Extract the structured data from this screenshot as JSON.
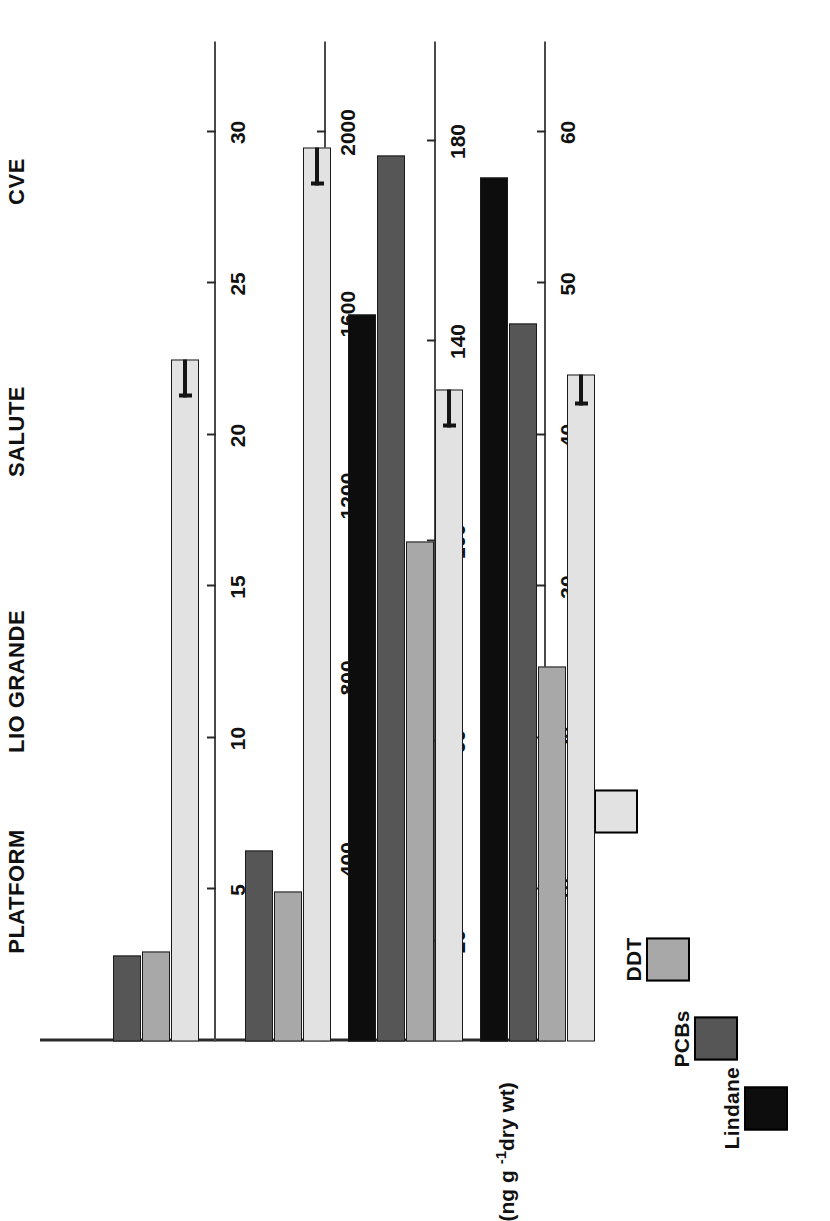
{
  "chart_data": {
    "type": "bar",
    "title": "",
    "orientation": "vertical-grouped-multi-axis",
    "categories": [
      "PLATFORM",
      "LIO GRANDE",
      "SALUTE",
      "CVE"
    ],
    "xlabel": "",
    "ylabel": "",
    "units_label": "(ng g",
    "units_sup": "-1",
    "units_tail": "dry wt)",
    "legend_position": "top-left",
    "grid": false,
    "series": [
      {
        "name": "Lindane",
        "color": "#0d0d0d",
        "axis": "lindane",
        "unit": "ng g-1 dry wt",
        "ylim": [
          0,
          33
        ],
        "ticks": [
          5,
          10,
          15,
          20,
          25,
          30
        ],
        "values": [
          0,
          0,
          24.0,
          28.5
        ],
        "errors": [
          0,
          0,
          0,
          0
        ]
      },
      {
        "name": "PCBs",
        "color": "#565656",
        "axis": "pcbs",
        "unit": "ng g-1 dry wt",
        "ylim": [
          0,
          2200
        ],
        "ticks": [
          400,
          800,
          1200,
          1600,
          2000
        ],
        "values": [
          190,
          420,
          1950,
          1580
        ],
        "errors": [
          0,
          0,
          0,
          0
        ]
      },
      {
        "name": "DDT",
        "color": "#a8a8a8",
        "axis": "ddt",
        "unit": "ng g-1 dry wt",
        "ylim": [
          0,
          200
        ],
        "ticks": [
          20,
          60,
          100,
          140,
          180
        ],
        "values": [
          18,
          30,
          100,
          75
        ],
        "errors": [
          0,
          0,
          0,
          0
        ]
      },
      {
        "name": "Phagocytosis (%)",
        "color": "#e2e2e2",
        "axis": "phago",
        "unit": "%",
        "ylim": [
          0,
          66
        ],
        "ticks": [
          10,
          20,
          30,
          40,
          50,
          60
        ],
        "values": [
          45,
          59,
          43,
          44
        ],
        "errors": [
          2.5,
          2.5,
          2.5,
          2.0
        ]
      }
    ],
    "axes": [
      {
        "key": "lindane",
        "label": "Lindane",
        "ticks": [
          5,
          10,
          15,
          20,
          25,
          30
        ],
        "max": 33
      },
      {
        "key": "pcbs",
        "label": "PCBs",
        "ticks": [
          400,
          800,
          1200,
          1600,
          2000
        ],
        "max": 2200
      },
      {
        "key": "ddt",
        "label": "DDT",
        "ticks": [
          20,
          60,
          100,
          140,
          180
        ],
        "max": 200
      },
      {
        "key": "phago",
        "label": "Phagocytosis (%)",
        "ticks": [
          10,
          20,
          30,
          40,
          50,
          60
        ],
        "max": 66
      }
    ]
  },
  "legend": {
    "items": [
      {
        "label": "Lindane",
        "color": "#0d0d0d"
      },
      {
        "label": "PCBs",
        "color": "#565656"
      },
      {
        "label": "DDT",
        "color": "#a8a8a8"
      },
      {
        "label": "Phagocytosis (%)",
        "color": "#e2e2e2"
      }
    ]
  },
  "colors": {
    "lindane": "#0d0d0d",
    "pcbs": "#565656",
    "ddt": "#a8a8a8",
    "phagocytosis": "#e2e2e2",
    "axis": "#4a4a4a",
    "text": "#111111"
  }
}
